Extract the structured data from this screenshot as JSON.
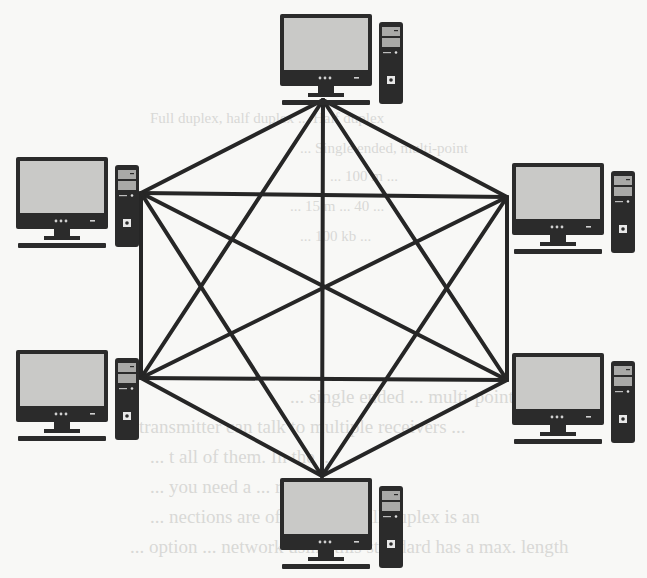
{
  "diagram": {
    "type": "full-mesh-network-topology",
    "node_count": 6,
    "link_count": 15,
    "colors": {
      "link": "#262626",
      "device_body": "#2b2b2b",
      "screen": "#c9c9c7",
      "drive_bay": "#a9a9a7",
      "background": "#f8f8f6",
      "bleed_text": "#d9d9d6"
    },
    "nodes": [
      {
        "id": "top",
        "label": "computer-top",
        "hub": [
          323,
          100
        ],
        "icon_origin": [
          280,
          14
        ]
      },
      {
        "id": "left-top",
        "label": "computer-left-top",
        "hub": [
          141,
          193
        ],
        "icon_origin": [
          16,
          157
        ]
      },
      {
        "id": "right-top",
        "label": "computer-right-top",
        "hub": [
          507,
          197
        ],
        "icon_origin": [
          512,
          163
        ]
      },
      {
        "id": "left-bottom",
        "label": "computer-left-bottom",
        "hub": [
          141,
          378
        ],
        "icon_origin": [
          16,
          350
        ]
      },
      {
        "id": "right-bottom",
        "label": "computer-right-bottom",
        "hub": [
          507,
          380
        ],
        "icon_origin": [
          512,
          353
        ]
      },
      {
        "id": "bottom",
        "label": "computer-bottom",
        "hub": [
          322,
          476
        ],
        "icon_origin": [
          280,
          478
        ]
      }
    ],
    "links": [
      [
        "top",
        "left-top"
      ],
      [
        "top",
        "right-top"
      ],
      [
        "top",
        "left-bottom"
      ],
      [
        "top",
        "right-bottom"
      ],
      [
        "top",
        "bottom"
      ],
      [
        "left-top",
        "right-top"
      ],
      [
        "left-top",
        "left-bottom"
      ],
      [
        "left-top",
        "right-bottom"
      ],
      [
        "left-top",
        "bottom"
      ],
      [
        "right-top",
        "left-bottom"
      ],
      [
        "right-top",
        "right-bottom"
      ],
      [
        "right-top",
        "bottom"
      ],
      [
        "left-bottom",
        "right-bottom"
      ],
      [
        "left-bottom",
        "bottom"
      ],
      [
        "right-bottom",
        "bottom"
      ]
    ]
  },
  "bleed_through_text": {
    "lines_upper": [
      "Full duplex, half duplex  ...  Half duplex",
      "...  Single ended, multi-point",
      "...  100 m ...",
      "... 15 m ...  40 ...",
      "... 100 kb ..."
    ],
    "lines_lower": [
      "... single ended ... multi-point ...",
      "... transmitter can talk to multiple receivers ...",
      "... t all of them. In the ... ",
      "... you need a ... receivers ...",
      "... nections are often ... but full duplex is an",
      "... option ... network using this standard has a max. length"
    ]
  }
}
